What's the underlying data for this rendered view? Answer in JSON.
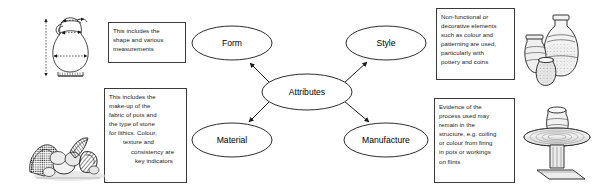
{
  "diagram": {
    "type": "concept-map",
    "center": {
      "label": "Attributes"
    },
    "nodes": [
      {
        "id": "form",
        "label": "Form"
      },
      {
        "id": "style",
        "label": "Style"
      },
      {
        "id": "material",
        "label": "Material"
      },
      {
        "id": "manufacture",
        "label": "Manufacture"
      }
    ],
    "notes": {
      "form": {
        "lines": [
          "This includes the",
          "shape and various",
          "measurements"
        ]
      },
      "material": {
        "lines": [
          "This includes the",
          "make-up of the",
          "fabric of pots and",
          "the type of stone",
          "for lithics. Colour,",
          "texture and",
          "consistency are",
          "key indicators"
        ]
      },
      "style": {
        "lines": [
          "Non-functional or",
          "decorative elements",
          "such as colour and",
          "patterning are used,",
          "particularly with",
          "pottery and coins"
        ]
      },
      "manufacture": {
        "lines": [
          "Evidence of the",
          "process used may",
          "remain in the",
          "structure, e.g. coiling",
          "or colour from firing",
          "in pots or workings",
          "on flints"
        ]
      }
    },
    "illustrations": [
      {
        "id": "jug-with-measurements-illustration",
        "alt": "Line drawing of a jug with dimension arrows"
      },
      {
        "id": "flint-stones-illustration",
        "alt": "Engraving of flints and stones"
      },
      {
        "id": "pottery-vessels-illustration",
        "alt": "Engraving of three pottery vessels"
      },
      {
        "id": "potters-wheel-illustration",
        "alt": "Engraving of a pot on a potter's wheel"
      }
    ]
  },
  "colors": {
    "stroke": "#3a3a3a",
    "text": "#000000",
    "background": "#ffffff"
  }
}
